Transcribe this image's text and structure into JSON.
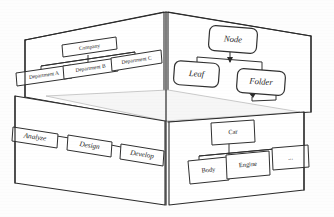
{
  "figure": {
    "background_color": "#fdfdfd",
    "line_color": "#2b2b2b",
    "box_fill": "#ffffff"
  },
  "panels": [
    {
      "id": "top-left-panel",
      "name": "organization-chart-panel",
      "diagram_type": "tree",
      "root": "Company",
      "nodes": [
        {
          "id": "company",
          "label": "Company",
          "level": 0
        },
        {
          "id": "dept-a",
          "label": "Department A",
          "level": 1
        },
        {
          "id": "dept-b",
          "label": "Department B",
          "level": 1
        },
        {
          "id": "dept-c",
          "label": "Department C",
          "level": 1
        }
      ],
      "edges": [
        {
          "from": "company",
          "to": "dept-a"
        },
        {
          "from": "company",
          "to": "dept-b"
        },
        {
          "from": "company",
          "to": "dept-c"
        }
      ]
    },
    {
      "id": "top-right-panel",
      "name": "node-tree-panel",
      "diagram_type": "tree",
      "root": "Node",
      "nodes": [
        {
          "id": "node",
          "label": "Node",
          "level": 0
        },
        {
          "id": "leaf",
          "label": "Leaf",
          "level": 1
        },
        {
          "id": "folder",
          "label": "Folder",
          "level": 1
        }
      ],
      "edges": [
        {
          "from": "node",
          "to": "leaf"
        },
        {
          "from": "node",
          "to": "folder"
        }
      ]
    },
    {
      "id": "bottom-left-panel",
      "name": "process-flow-panel",
      "diagram_type": "flow",
      "nodes": [
        {
          "id": "analyze",
          "label": "Analyze",
          "step": 1
        },
        {
          "id": "design",
          "label": "Design",
          "step": 2
        },
        {
          "id": "develop",
          "label": "Develop",
          "step": 3
        }
      ],
      "edges": [
        {
          "from": "analyze",
          "to": "design"
        },
        {
          "from": "design",
          "to": "develop"
        }
      ]
    },
    {
      "id": "bottom-right-panel",
      "name": "car-decomposition-panel",
      "diagram_type": "tree",
      "root": "Car",
      "nodes": [
        {
          "id": "car",
          "label": "Car",
          "level": 0
        },
        {
          "id": "body",
          "label": "Body",
          "level": 1
        },
        {
          "id": "engine",
          "label": "Engine",
          "level": 1
        },
        {
          "id": "more",
          "label": "...",
          "level": 1
        }
      ],
      "edges": [
        {
          "from": "car",
          "to": "body"
        },
        {
          "from": "car",
          "to": "engine"
        },
        {
          "from": "car",
          "to": "more"
        }
      ]
    }
  ],
  "labels": {
    "company": "Company",
    "dept_a": "Department A",
    "dept_b": "Department B",
    "dept_c": "Department C",
    "node": "Node",
    "leaf": "Leaf",
    "folder": "Folder",
    "analyze": "Analyze",
    "design": "Design",
    "develop": "Develop",
    "car": "Car",
    "body": "Body",
    "engine": "Engine",
    "more": "..."
  }
}
